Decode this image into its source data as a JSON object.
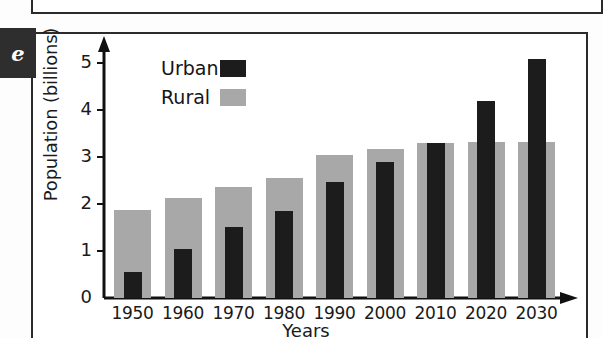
{
  "panel": {
    "tag": "e"
  },
  "chart_data": {
    "type": "bar",
    "title": "",
    "xlabel": "Years",
    "ylabel": "Population (billions)",
    "categories": [
      "1950",
      "1960",
      "1970",
      "1980",
      "1990",
      "2000",
      "2010",
      "2020",
      "2030"
    ],
    "series": [
      {
        "name": "Urban",
        "color": "#1c1c1c",
        "values": [
          0.55,
          1.05,
          1.52,
          1.85,
          2.47,
          2.9,
          3.3,
          4.2,
          5.08
        ]
      },
      {
        "name": "Rural",
        "color": "#a8a8a8",
        "values": [
          1.88,
          2.12,
          2.36,
          2.55,
          3.05,
          3.18,
          3.3,
          3.32,
          3.32
        ]
      }
    ],
    "ylim": [
      0,
      5.35
    ],
    "yticks": [
      0,
      1,
      2,
      3,
      4,
      5
    ],
    "ytick_labels": [
      "0",
      "1",
      "2",
      "3",
      "4",
      "5"
    ],
    "grid": false,
    "legend_position": "upper-left",
    "axis_style": "arrowed-L"
  }
}
